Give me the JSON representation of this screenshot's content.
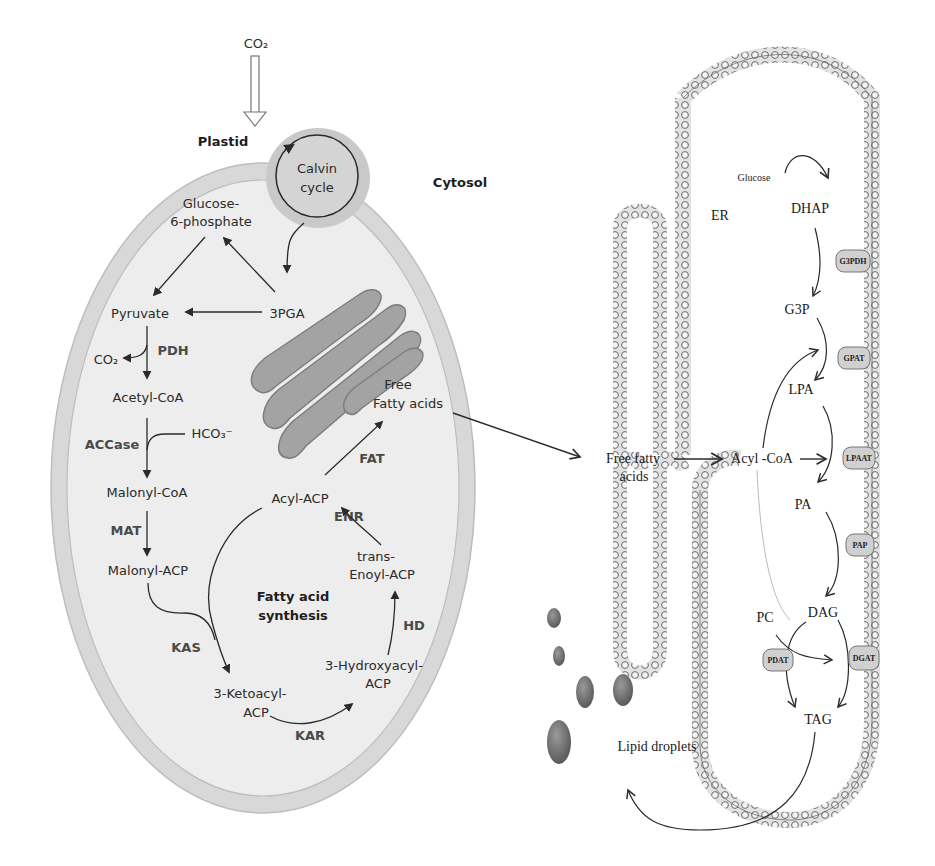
{
  "plastid_panel": {
    "co2_in": "CO₂",
    "plastid_label": "Plastid",
    "cytosol_label": "Cytosol",
    "calvin_cycle": [
      "Calvin",
      "cycle"
    ],
    "glucose_6_phosphate": [
      "Glucose-",
      "6-phosphate"
    ],
    "pga": "3PGA",
    "pyruvate": "Pyruvate",
    "co2_out": "CO₂",
    "pdh": "PDH",
    "acetyl_coa": "Acetyl-CoA",
    "accase": "ACCase",
    "bicarbonate": "HCO₃⁻",
    "malonyl_coa": "Malonyl-CoA",
    "mat": "MAT",
    "malonyl_acp": "Malonyl-ACP",
    "kas": "KAS",
    "ketoacyl_acp": [
      "3-Ketoacyl-",
      "ACP"
    ],
    "kar": "KAR",
    "hydroxyacyl_acp": [
      "3-Hydroxyacyl-",
      "ACP"
    ],
    "hd": "HD",
    "enoyl_acp": [
      "trans-",
      "Enoyl-ACP"
    ],
    "enr": "ENR",
    "acyl_acp": "Acyl-ACP",
    "fat": "FAT",
    "free_fatty_acids": [
      "Free",
      "Fatty acids"
    ],
    "fatty_acid_synthesis": [
      "Fatty acid",
      "synthesis"
    ]
  },
  "er_panel": {
    "free_fatty_acids": [
      "Free fatty",
      "acids"
    ],
    "acyl_coa": "Acyl -CoA",
    "er_label": "ER",
    "glucose": "Glucose",
    "dhap": "DHAP",
    "g3p": "G3P",
    "lpa": "LPA",
    "pa": "PA",
    "dag": "DAG",
    "tag": "TAG",
    "pc": "PC",
    "lipid_droplets": "Lipid droplets",
    "enzymes": {
      "g3pdh": "G3PDH",
      "gpat": "GPAT",
      "lpaat": "LPAAT",
      "pap": "PAP",
      "dgat": "DGAT",
      "pdat": "PDAT"
    }
  },
  "colors": {
    "cell_wall": "#d6d6d6",
    "cell_inner": "#ececec",
    "calvin_halo": "#c6c6c6",
    "thylakoid": "#9a9a9a",
    "membrane": "#8a8a8a",
    "droplet": "#6e6e6e",
    "text": "#2a2a2a"
  }
}
